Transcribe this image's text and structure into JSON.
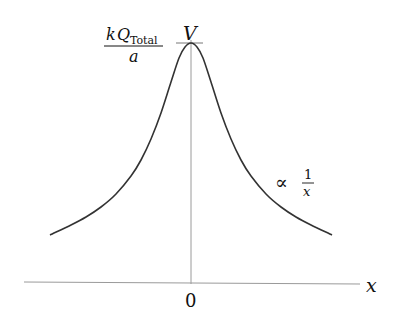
{
  "diagram": {
    "peak_label": {
      "numerator_k": "k",
      "numerator_Q": "Q",
      "numerator_sub": "Total",
      "denominator": "a"
    },
    "y_axis_label": "V",
    "x_axis_label": "x",
    "origin_label": "0",
    "asymptote_label": {
      "symbol": "∝",
      "numerator": "1",
      "denominator": "x"
    },
    "colors": {
      "curve": "#333333",
      "axes": "#9a9a9a",
      "text": "#111111"
    },
    "curve": {
      "description": "V(x) peaks at x=0 with value kQ_Total/a and decays as 1/x for large |x|",
      "points_right": [
        [
          0,
          43
        ],
        [
          6,
          47
        ],
        [
          12,
          58
        ],
        [
          20,
          82
        ],
        [
          30,
          113
        ],
        [
          40,
          139
        ],
        [
          50,
          160
        ],
        [
          60,
          176
        ],
        [
          75,
          194
        ],
        [
          90,
          207
        ],
        [
          105,
          217
        ],
        [
          120,
          225
        ],
        [
          141,
          235
        ]
      ]
    }
  }
}
